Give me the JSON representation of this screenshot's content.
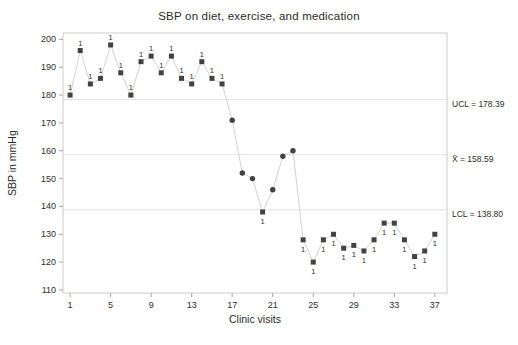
{
  "figure": {
    "title": "SBP on diet, exercise, and medication",
    "xlabel": "Clinic visits",
    "ylabel": "SBP in mmHg",
    "annotations": {
      "ucl_label": "UCL = 178.39",
      "mean_label": "X̄ = 158.59",
      "lcl_label": "LCL = 138.80"
    }
  },
  "chart_data": {
    "type": "line",
    "subtype": "individuals-control-chart",
    "title": "SBP on diet, exercise, and medication",
    "xlabel": "Clinic visits",
    "ylabel": "SBP in mmHg",
    "x": [
      1,
      2,
      3,
      4,
      5,
      6,
      7,
      8,
      9,
      10,
      11,
      12,
      13,
      14,
      15,
      16,
      17,
      18,
      19,
      20,
      21,
      22,
      23,
      24,
      25,
      26,
      27,
      28,
      29,
      30,
      31,
      32,
      33,
      34,
      35,
      36,
      37
    ],
    "values": [
      180,
      196,
      184,
      186,
      198,
      188,
      180,
      192,
      194,
      188,
      194,
      186,
      184,
      192,
      186,
      184,
      171,
      152,
      150,
      138,
      146,
      158,
      160,
      128,
      120,
      128,
      130,
      125,
      126,
      124,
      128,
      134,
      134,
      128,
      122,
      124,
      130
    ],
    "ucl": 178.39,
    "center": 158.59,
    "lcl": 138.8,
    "flag_label": "1",
    "xticks": [
      1,
      5,
      9,
      13,
      17,
      21,
      25,
      29,
      33,
      37
    ],
    "yticks": [
      110,
      120,
      130,
      140,
      150,
      160,
      170,
      180,
      190,
      200
    ],
    "xlim": [
      0.3,
      38.2
    ],
    "ylim": [
      108.9,
      202.3
    ],
    "grid": "reference-lines-only",
    "legend": "none",
    "colors": {
      "marker": "#424242",
      "series_line": "#d2d2d2",
      "reference_line": "#e2e2e2",
      "frame": "#cccccc",
      "tick": "#a6a6a6",
      "text": "#2e2e2e"
    }
  }
}
